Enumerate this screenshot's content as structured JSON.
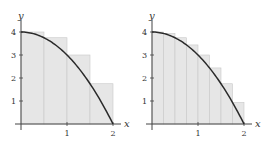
{
  "chart_data": [
    {
      "type": "bar",
      "title": "",
      "function": "y = 4 - x^2",
      "method": "left-endpoint rectangles",
      "n": 4,
      "xlabel": "x",
      "ylabel": "y",
      "xlim": [
        0,
        2
      ],
      "ylim": [
        0,
        4
      ],
      "x_ticks": [
        "1",
        "2"
      ],
      "y_ticks": [
        "1",
        "2",
        "3",
        "4"
      ],
      "bar_edges": [
        0,
        0.5,
        1.0,
        1.5,
        2.0
      ],
      "values": [
        4,
        3.75,
        3,
        1.75
      ]
    },
    {
      "type": "bar",
      "title": "",
      "function": "y = 4 - x^2",
      "method": "left-endpoint rectangles",
      "n": 8,
      "xlabel": "x",
      "ylabel": "y",
      "xlim": [
        0,
        2
      ],
      "ylim": [
        0,
        4
      ],
      "x_ticks": [
        "1",
        "2"
      ],
      "y_ticks": [
        "1",
        "2",
        "3",
        "4"
      ],
      "bar_edges": [
        0,
        0.25,
        0.5,
        0.75,
        1.0,
        1.25,
        1.5,
        1.75,
        2.0
      ],
      "values": [
        4,
        3.9375,
        3.75,
        3.4375,
        3,
        2.4375,
        1.75,
        0.9375
      ]
    }
  ],
  "colors": {
    "bar_fill": "#e6e6e6",
    "bar_edge": "#c8c8c8",
    "curve": "#2a2a2a",
    "axis": "#444444"
  }
}
